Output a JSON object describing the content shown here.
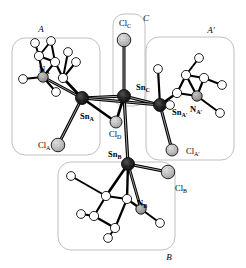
{
  "figure": {
    "width": 246,
    "height": 268,
    "background": "#ffffff"
  },
  "palette": {
    "tin": "#1a1a1a",
    "chlorine": "#b4b4b4",
    "nitrogen": "#9a9a9a",
    "carbon": "#ffffff",
    "hydrogen": "#ffffff",
    "bond": "#000000",
    "bond_highlight": "#f2f2f2",
    "region_border": "#b9b9bd",
    "outline": "#111111"
  },
  "regions": [
    {
      "id": "A",
      "label": "A",
      "label_x": 41,
      "label_y": 30,
      "x": 12,
      "y": 38,
      "w": 88,
      "h": 117,
      "r": 13
    },
    {
      "id": "Ap",
      "label": "A′",
      "label_x": 211,
      "label_y": 31,
      "x": 146,
      "y": 37,
      "w": 88,
      "h": 123,
      "r": 13
    },
    {
      "id": "B",
      "label": "B",
      "label_x": 169,
      "label_y": 258,
      "x": 58,
      "y": 162,
      "w": 117,
      "h": 88,
      "r": 13
    },
    {
      "id": "C",
      "label": "C",
      "label_x": 146,
      "label_y": 19,
      "x": 113,
      "y": 14,
      "w": 32,
      "h": 92,
      "r": 11
    }
  ],
  "atom_labels": [
    {
      "id": "Sn_A",
      "base": "Sn",
      "sub": "A",
      "bold": true,
      "x": 80,
      "y": 117
    },
    {
      "id": "Sn_B",
      "base": "Sn",
      "sub": "B",
      "bold": true,
      "x": 108,
      "y": 155
    },
    {
      "id": "Sn_C",
      "base": "Sn",
      "sub": "C",
      "bold": true,
      "x": 136,
      "y": 88
    },
    {
      "id": "Sn_Ap",
      "base": "Sn",
      "sub": "A′",
      "bold": true,
      "x": 172,
      "y": 113
    },
    {
      "id": "N_A",
      "base": "N",
      "sub": "A",
      "bold": true,
      "x": 39,
      "y": 70
    },
    {
      "id": "N_B",
      "base": "N",
      "sub": "B",
      "bold": true,
      "x": 137,
      "y": 204
    },
    {
      "id": "N_Ap",
      "base": "N",
      "sub": "A′",
      "bold": true,
      "x": 190,
      "y": 110
    },
    {
      "id": "Cl_A",
      "base": "Cl",
      "sub": "A",
      "bold": false,
      "x": 38,
      "y": 146
    },
    {
      "id": "Cl_B",
      "base": "Cl",
      "sub": "B",
      "bold": false,
      "x": 175,
      "y": 189
    },
    {
      "id": "Cl_C",
      "base": "Cl",
      "sub": "C",
      "bold": false,
      "x": 119,
      "y": 24
    },
    {
      "id": "Cl_D",
      "base": "Cl",
      "sub": "D",
      "bold": false,
      "x": 109,
      "y": 135
    },
    {
      "id": "Cl_Ap",
      "base": "Cl",
      "sub": "A′",
      "bold": false,
      "x": 186,
      "y": 152
    }
  ],
  "atoms": [
    {
      "id": "SnA",
      "el": "Sn",
      "x": 82,
      "y": 98,
      "r": 6.5
    },
    {
      "id": "SnB",
      "el": "Sn",
      "x": 128,
      "y": 164,
      "r": 6.5
    },
    {
      "id": "SnC",
      "el": "Sn",
      "x": 124,
      "y": 96,
      "r": 6.5
    },
    {
      "id": "SnAp",
      "el": "Sn",
      "x": 160,
      "y": 105,
      "r": 6.5
    },
    {
      "id": "ClA",
      "el": "Cl",
      "x": 58,
      "y": 145,
      "r": 6.8
    },
    {
      "id": "ClB",
      "el": "Cl",
      "x": 168,
      "y": 172,
      "r": 6.8
    },
    {
      "id": "ClC",
      "el": "Cl",
      "x": 124,
      "y": 40,
      "r": 6.8
    },
    {
      "id": "ClD",
      "el": "Cl",
      "x": 116,
      "y": 122,
      "r": 6.0
    },
    {
      "id": "ClAp",
      "el": "Cl",
      "x": 172,
      "y": 150,
      "r": 6.0
    },
    {
      "id": "NA",
      "el": "N",
      "x": 43,
      "y": 77,
      "r": 5.2
    },
    {
      "id": "NB",
      "el": "N",
      "x": 141,
      "y": 209,
      "r": 5.2
    },
    {
      "id": "NAp",
      "el": "N",
      "x": 197,
      "y": 96,
      "r": 5.2
    },
    {
      "id": "CA1",
      "el": "C",
      "x": 63,
      "y": 78,
      "r": 4.6
    },
    {
      "id": "CA2",
      "el": "C",
      "x": 55,
      "y": 62,
      "r": 4.6
    },
    {
      "id": "CA3",
      "el": "C",
      "x": 39,
      "y": 56,
      "r": 4.6
    },
    {
      "id": "CB1",
      "el": "C",
      "x": 106,
      "y": 196,
      "r": 4.6
    },
    {
      "id": "CB2",
      "el": "C",
      "x": 127,
      "y": 199,
      "r": 4.6
    },
    {
      "id": "CB3",
      "el": "C",
      "x": 94,
      "y": 216,
      "r": 4.6
    },
    {
      "id": "CB4",
      "el": "C",
      "x": 115,
      "y": 228,
      "r": 4.6
    },
    {
      "id": "CP1",
      "el": "C",
      "x": 177,
      "y": 93,
      "r": 4.6
    },
    {
      "id": "CP2",
      "el": "C",
      "x": 186,
      "y": 75,
      "r": 4.6
    },
    {
      "id": "CP3",
      "el": "C",
      "x": 204,
      "y": 78,
      "r": 4.6
    },
    {
      "id": "HA1",
      "el": "H",
      "x": 35,
      "y": 43,
      "r": 4.4
    },
    {
      "id": "HA2",
      "el": "H",
      "x": 51,
      "y": 41,
      "r": 4.4
    },
    {
      "id": "HA3",
      "el": "H",
      "x": 68,
      "y": 52,
      "r": 4.4
    },
    {
      "id": "HA4",
      "el": "H",
      "x": 76,
      "y": 62,
      "r": 4.4
    },
    {
      "id": "HA5",
      "el": "H",
      "x": 23,
      "y": 79,
      "r": 4.4
    },
    {
      "id": "HA6",
      "el": "H",
      "x": 56,
      "y": 92,
      "r": 4.4
    },
    {
      "id": "HB1",
      "el": "H",
      "x": 71,
      "y": 176,
      "r": 4.4
    },
    {
      "id": "HB2",
      "el": "H",
      "x": 81,
      "y": 214,
      "r": 4.4
    },
    {
      "id": "HB3",
      "el": "H",
      "x": 108,
      "y": 238,
      "r": 4.4
    },
    {
      "id": "HB4",
      "el": "H",
      "x": 160,
      "y": 223,
      "r": 4.4
    },
    {
      "id": "HP1",
      "el": "H",
      "x": 158,
      "y": 69,
      "r": 4.4
    },
    {
      "id": "HP2",
      "el": "H",
      "x": 199,
      "y": 58,
      "r": 4.4
    },
    {
      "id": "HP3",
      "el": "H",
      "x": 222,
      "y": 85,
      "r": 4.4
    },
    {
      "id": "HP4",
      "el": "H",
      "x": 220,
      "y": 113,
      "r": 4.4
    },
    {
      "id": "HP5",
      "el": "H",
      "x": 170,
      "y": 105,
      "r": 4.4
    }
  ],
  "bonds": [
    {
      "a": "SnC",
      "b": "ClC",
      "w": 3.0
    },
    {
      "a": "SnC",
      "b": "SnA",
      "w": 3.2
    },
    {
      "a": "SnC",
      "b": "SnAp",
      "w": 3.2
    },
    {
      "a": "SnC",
      "b": "SnB",
      "w": 3.2
    },
    {
      "a": "SnC",
      "b": "ClD",
      "w": 2.6
    },
    {
      "a": "SnA",
      "b": "ClD",
      "w": 2.6
    },
    {
      "a": "SnA",
      "b": "ClA",
      "w": 3.0
    },
    {
      "a": "SnA",
      "b": "NA",
      "w": 2.8
    },
    {
      "a": "SnA",
      "b": "CA1",
      "w": 2.6
    },
    {
      "a": "SnA",
      "b": "SnAp",
      "w": 3.0
    },
    {
      "a": "SnAp",
      "b": "ClAp",
      "w": 3.0
    },
    {
      "a": "SnAp",
      "b": "CP1",
      "w": 2.6
    },
    {
      "a": "SnAp",
      "b": "HP1",
      "w": 2.2
    },
    {
      "a": "SnAp",
      "b": "HP5",
      "w": 2.0
    },
    {
      "a": "SnB",
      "b": "ClB",
      "w": 3.0
    },
    {
      "a": "SnB",
      "b": "NB",
      "w": 2.8
    },
    {
      "a": "SnB",
      "b": "CB1",
      "w": 2.6
    },
    {
      "a": "SnB",
      "b": "CB2",
      "w": 2.4
    },
    {
      "a": "NA",
      "b": "CA2",
      "w": 2.2
    },
    {
      "a": "NA",
      "b": "HA5",
      "w": 2.0
    },
    {
      "a": "NA",
      "b": "HA6",
      "w": 2.0
    },
    {
      "a": "CA1",
      "b": "CA2",
      "w": 2.2
    },
    {
      "a": "CA1",
      "b": "HA3",
      "w": 2.0
    },
    {
      "a": "CA1",
      "b": "HA4",
      "w": 2.0
    },
    {
      "a": "CA2",
      "b": "CA3",
      "w": 2.2
    },
    {
      "a": "CA2",
      "b": "HA2",
      "w": 2.0
    },
    {
      "a": "CA3",
      "b": "HA1",
      "w": 2.0
    },
    {
      "a": "CA3",
      "b": "HA2",
      "w": 2.0
    },
    {
      "a": "CA3",
      "b": "NA",
      "w": 2.2
    },
    {
      "a": "NB",
      "b": "CB2",
      "w": 2.2
    },
    {
      "a": "NB",
      "b": "HB4",
      "w": 2.0
    },
    {
      "a": "CB1",
      "b": "CB2",
      "w": 2.2
    },
    {
      "a": "CB1",
      "b": "CB3",
      "w": 2.2
    },
    {
      "a": "CB1",
      "b": "HB1",
      "w": 2.0
    },
    {
      "a": "CB3",
      "b": "CB4",
      "w": 2.2
    },
    {
      "a": "CB3",
      "b": "HB2",
      "w": 2.0
    },
    {
      "a": "CB4",
      "b": "CB2",
      "w": 2.2
    },
    {
      "a": "CB4",
      "b": "HB3",
      "w": 2.0
    },
    {
      "a": "NAp",
      "b": "CP1",
      "w": 2.2
    },
    {
      "a": "NAp",
      "b": "CP3",
      "w": 2.2
    },
    {
      "a": "NAp",
      "b": "HP4",
      "w": 2.0
    },
    {
      "a": "CP1",
      "b": "CP2",
      "w": 2.2
    },
    {
      "a": "CP2",
      "b": "CP3",
      "w": 2.2
    },
    {
      "a": "CP2",
      "b": "HP2",
      "w": 2.0
    },
    {
      "a": "CP3",
      "b": "HP3",
      "w": 2.0
    },
    {
      "a": "CP2",
      "b": "NAp",
      "w": 2.2
    }
  ],
  "element_styles": {
    "Sn": {
      "fill": "#1c1c1c",
      "stroke": "#000000",
      "texture": "cross"
    },
    "Cl": {
      "fill": "#bcbcbc",
      "stroke": "#222222",
      "texture": "stipple"
    },
    "N": {
      "fill": "#9c9c9c",
      "stroke": "#222222",
      "texture": "stipple"
    },
    "C": {
      "fill": "#ffffff",
      "stroke": "#111111",
      "texture": "none"
    },
    "H": {
      "fill": "#ffffff",
      "stroke": "#111111",
      "texture": "none"
    }
  }
}
